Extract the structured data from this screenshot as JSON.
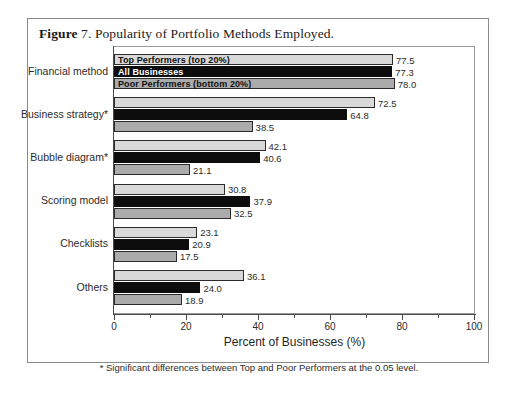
{
  "figure": {
    "label_bold": "Figure",
    "caption_rest": " 7. Popularity of Portfolio Methods Employed."
  },
  "footnote": "* Significant differences between Top and Poor Performers at the 0.05 level.",
  "legend": {
    "entries": [
      {
        "label": "Top Performers (top 20%)",
        "color": "#d9d9d9",
        "text_on": "light"
      },
      {
        "label": "All Businesses",
        "color": "#0d0d0d",
        "text_on": "dark"
      },
      {
        "label": "Poor Performers (bottom 20%)",
        "color": "#ababab",
        "text_on": "light"
      }
    ]
  },
  "chart_data": {
    "type": "bar",
    "orientation": "horizontal",
    "title": "Popularity of Portfolio Methods Employed",
    "xlabel": "Percent of Businesses (%)",
    "ylabel": "",
    "xlim": [
      0,
      100
    ],
    "xticks": [
      0,
      20,
      40,
      60,
      80,
      100
    ],
    "xtick_labels": [
      "0",
      "20",
      "40",
      "60",
      "80",
      "100"
    ],
    "minor_xticks": [
      10,
      30,
      50,
      70,
      90
    ],
    "grid": false,
    "legend_position": "overlaid-on-first-group",
    "categories": [
      "Financial method",
      "Business strategy*",
      "Bubble diagram*",
      "Scoring model",
      "Checklists",
      "Others"
    ],
    "series": [
      {
        "name": "Top Performers (top 20%)",
        "color": "#d9d9d9",
        "values": [
          77.5,
          72.5,
          42.1,
          30.8,
          23.1,
          36.1
        ]
      },
      {
        "name": "All Businesses",
        "color": "#0d0d0d",
        "values": [
          77.3,
          64.8,
          40.6,
          37.9,
          20.9,
          24.0
        ]
      },
      {
        "name": "Poor Performers (bottom 20%)",
        "color": "#ababab",
        "values": [
          78.0,
          38.5,
          21.1,
          32.5,
          17.5,
          18.9
        ]
      }
    ],
    "value_labels": [
      [
        "77.5",
        "77.3",
        "78.0"
      ],
      [
        "72.5",
        "64.8",
        "38.5"
      ],
      [
        "42.1",
        "40.6",
        "21.1"
      ],
      [
        "30.8",
        "37.9",
        "32.5"
      ],
      [
        "23.1",
        "20.9",
        "17.5"
      ],
      [
        "36.1",
        "24.0",
        "18.9"
      ]
    ]
  }
}
